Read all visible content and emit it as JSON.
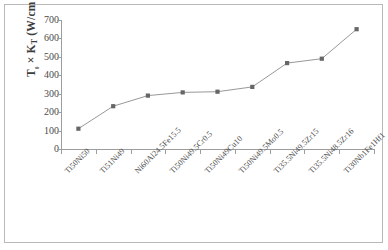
{
  "chart_data": {
    "type": "line",
    "title": "",
    "xlabel": "",
    "ylabel": "T₀ × Kᴛ (W/cm °C)",
    "ylabel_parts": {
      "main1": "T",
      "sub1": "₀",
      "times": " × ",
      "main2": "K",
      "sub2": "T",
      "units": " (W/cm °C)"
    },
    "ylim": [
      0,
      700
    ],
    "yticks": [
      700,
      600,
      500,
      400,
      300,
      200,
      100,
      0
    ],
    "grid": false,
    "legend": "none",
    "categories": [
      "Ti50Ni50",
      "Ti51Ni49",
      "Ni60Al24.5Fe15.5",
      "Ti50Ni49.5Cr0.5",
      "Ti50Ni49Cu10",
      "Ti50Ni49.5Mo0.5",
      "Ti35.5Ni49.5Zr15",
      "Ti35.5Ni48.5Zr16",
      "Ti30Nb1Fe1Hf1"
    ],
    "values": [
      110,
      232,
      290,
      307,
      311,
      337,
      466,
      490,
      650
    ],
    "series": [
      {
        "name": "T0 x KT",
        "values": [
          110,
          232,
          290,
          307,
          311,
          337,
          466,
          490,
          650
        ],
        "marker": "square",
        "marker_color": "#6b6b6b",
        "line_color": "#8c8c8c"
      }
    ],
    "colors": {
      "line": "#8c8c8c",
      "marker": "#666666",
      "axis": "#9d9d9d",
      "border": "#b9b9b9",
      "text": "#4a4a4a",
      "background": "#ffffff"
    }
  }
}
